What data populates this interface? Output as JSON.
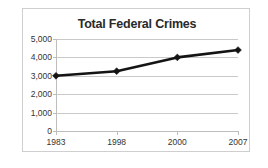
{
  "chart_data": {
    "type": "line",
    "title": "Total Federal Crimes",
    "xlabel": "",
    "ylabel": "",
    "categories": [
      "1983",
      "1998",
      "2000",
      "2007"
    ],
    "values": [
      3000,
      3250,
      4000,
      4400
    ],
    "series": [
      {
        "name": "Total Federal Crimes",
        "values": [
          3000,
          3250,
          4000,
          4400
        ]
      }
    ],
    "ylim": [
      0,
      5000
    ],
    "ytick_labels": [
      "0",
      "1,000",
      "2,000",
      "3,000",
      "4,000",
      "5,000"
    ],
    "ytick_values": [
      0,
      1000,
      2000,
      3000,
      4000,
      5000
    ],
    "grid": true,
    "legend": false,
    "legend_position": "none",
    "marker": "diamond",
    "line_color": "#141414",
    "marker_color": "#141414",
    "grid_color": "#c9c9c9",
    "axis_color": "#bdbdbd",
    "title_color": "#2a2a2a",
    "background": "#ffffff",
    "frame_color": "#cfcfcf"
  }
}
